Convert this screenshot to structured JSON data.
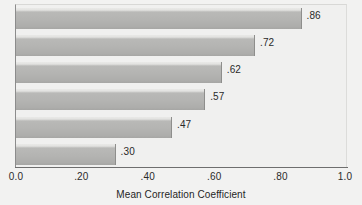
{
  "chart_data": {
    "type": "bar",
    "orientation": "horizontal",
    "title": "",
    "xlabel": "Mean Correlation Coefficient",
    "ylabel": "",
    "xlim": [
      0.0,
      1.0
    ],
    "grid": false,
    "legend": null,
    "categories": [
      "",
      "",
      "",
      "",
      "",
      ""
    ],
    "values": [
      0.86,
      0.72,
      0.62,
      0.57,
      0.47,
      0.3
    ],
    "value_labels": [
      ".86",
      ".72",
      ".62",
      ".57",
      ".47",
      ".30"
    ],
    "xticks": [
      0.0,
      0.2,
      0.4,
      0.6,
      0.8,
      1.0
    ],
    "xtick_labels": [
      "0.0",
      ".20",
      ".40",
      ".60",
      ".80",
      "1.0"
    ],
    "colors": {
      "bar_fill_light": "#e4e4e2",
      "bar_fill_dark": "#a9a9a7",
      "bar_edge": "#8e8e8c",
      "axis": "#6e6e6e",
      "text": "#2a2a2a",
      "background": "#f2f2f1",
      "plot_background": "#f0f0ef"
    }
  },
  "bars": [
    {
      "value": 0.86,
      "label": ".86"
    },
    {
      "value": 0.72,
      "label": ".72"
    },
    {
      "value": 0.62,
      "label": ".62"
    },
    {
      "value": 0.57,
      "label": ".57"
    },
    {
      "value": 0.47,
      "label": ".47"
    },
    {
      "value": 0.3,
      "label": ".30"
    }
  ],
  "axis": {
    "title": "Mean Correlation Coefficient",
    "ticks": [
      {
        "value": 0.0,
        "label": "0.0"
      },
      {
        "value": 0.2,
        "label": ".20"
      },
      {
        "value": 0.4,
        "label": ".40"
      },
      {
        "value": 0.6,
        "label": ".60"
      },
      {
        "value": 0.8,
        "label": ".80"
      },
      {
        "value": 1.0,
        "label": "1.0"
      }
    ]
  }
}
